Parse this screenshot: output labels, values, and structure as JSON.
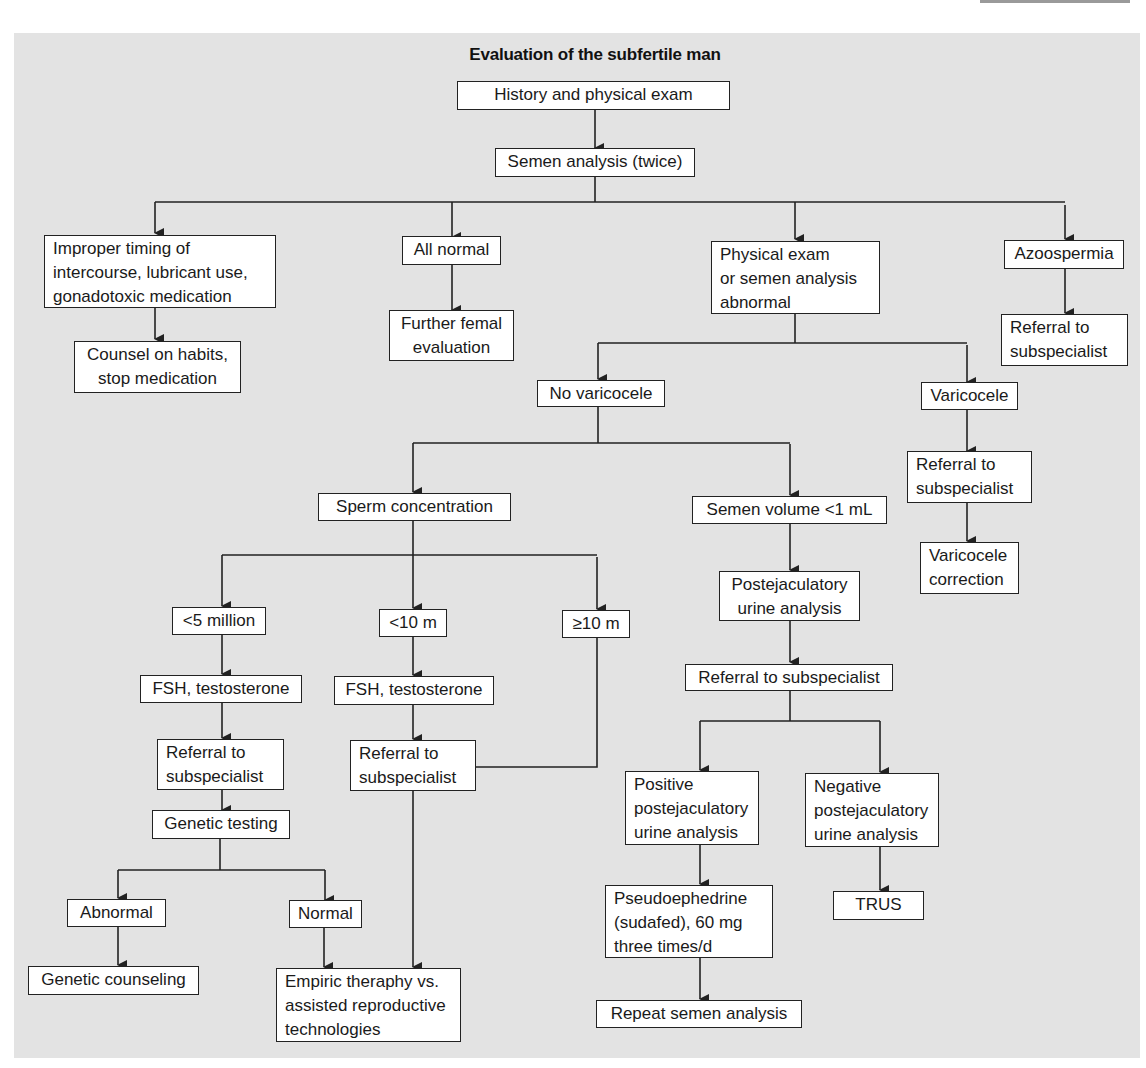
{
  "diagram": {
    "title": "Evaluation of the subfertile man",
    "nodes": {
      "history": {
        "lines": [
          "History and physical exam"
        ]
      },
      "semen_analysis": {
        "lines": [
          "Semen analysis (twice)"
        ]
      },
      "improper_timing": {
        "lines": [
          "Improper timing of",
          "intercourse, lubricant use,",
          "gonadotoxic medication"
        ]
      },
      "counsel": {
        "lines": [
          "Counsel on habits,",
          "stop medication"
        ]
      },
      "all_normal": {
        "lines": [
          "All normal"
        ]
      },
      "further_female": {
        "lines": [
          "Further femal",
          "evaluation"
        ]
      },
      "pe_abnormal": {
        "lines": [
          "Physical exam",
          "or semen analysis",
          "abnormal"
        ]
      },
      "azoospermia": {
        "lines": [
          "Azoospermia"
        ]
      },
      "azoo_referral": {
        "lines": [
          "Referral to",
          "subspecialist"
        ]
      },
      "no_varicocele": {
        "lines": [
          "No varicocele"
        ]
      },
      "varicocele": {
        "lines": [
          "Varicocele"
        ]
      },
      "vari_referral": {
        "lines": [
          "Referral to",
          "subspecialist"
        ]
      },
      "vari_correction": {
        "lines": [
          "Varicocele",
          "correction"
        ]
      },
      "sperm_conc": {
        "lines": [
          "Sperm concentration"
        ]
      },
      "semen_volume": {
        "lines": [
          "Semen volume <1 mL"
        ]
      },
      "lt5": {
        "lines": [
          "<5 million"
        ]
      },
      "lt10": {
        "lines": [
          "<10 m"
        ]
      },
      "ge10": {
        "lines": [
          "≥10 m"
        ]
      },
      "fsh1": {
        "lines": [
          "FSH, testosterone"
        ]
      },
      "fsh2": {
        "lines": [
          "FSH, testosterone"
        ]
      },
      "referral_a": {
        "lines": [
          "Referral to",
          "subspecialist"
        ]
      },
      "referral_b": {
        "lines": [
          "Referral to",
          "subspecialist"
        ]
      },
      "genetic_testing": {
        "lines": [
          "Genetic testing"
        ]
      },
      "abnormal": {
        "lines": [
          "Abnormal"
        ]
      },
      "normal": {
        "lines": [
          "Normal"
        ]
      },
      "genetic_counseling": {
        "lines": [
          "Genetic counseling"
        ]
      },
      "empiric": {
        "lines": [
          "Empiric theraphy vs.",
          "assisted reproductive",
          "technologies"
        ]
      },
      "post_ejac": {
        "lines": [
          "Postejaculatory",
          "urine analysis"
        ]
      },
      "referral_c": {
        "lines": [
          "Referral to subspecialist"
        ]
      },
      "positive_pea": {
        "lines": [
          "Positive",
          "postejaculatory",
          "urine analysis"
        ]
      },
      "negative_pea": {
        "lines": [
          "Negative",
          "postejaculatory",
          "urine analysis"
        ]
      },
      "pseudoephedrine": {
        "lines": [
          "Pseudoephedrine",
          "(sudafed), 60 mg",
          "three times/d"
        ]
      },
      "trus": {
        "lines": [
          "TRUS"
        ]
      },
      "repeat_semen": {
        "lines": [
          "Repeat semen analysis"
        ]
      }
    },
    "edges": [
      [
        "history",
        "semen_analysis"
      ],
      [
        "semen_analysis",
        "improper_timing"
      ],
      [
        "semen_analysis",
        "all_normal"
      ],
      [
        "semen_analysis",
        "pe_abnormal"
      ],
      [
        "semen_analysis",
        "azoospermia"
      ],
      [
        "improper_timing",
        "counsel"
      ],
      [
        "all_normal",
        "further_female"
      ],
      [
        "azoospermia",
        "azoo_referral"
      ],
      [
        "pe_abnormal",
        "no_varicocele"
      ],
      [
        "pe_abnormal",
        "varicocele"
      ],
      [
        "varicocele",
        "vari_referral"
      ],
      [
        "vari_referral",
        "vari_correction"
      ],
      [
        "no_varicocele",
        "sperm_conc"
      ],
      [
        "no_varicocele",
        "semen_volume"
      ],
      [
        "sperm_conc",
        "lt5"
      ],
      [
        "sperm_conc",
        "lt10"
      ],
      [
        "sperm_conc",
        "ge10"
      ],
      [
        "lt5",
        "fsh1"
      ],
      [
        "fsh1",
        "referral_a"
      ],
      [
        "referral_a",
        "genetic_testing"
      ],
      [
        "genetic_testing",
        "abnormal"
      ],
      [
        "genetic_testing",
        "normal"
      ],
      [
        "abnormal",
        "genetic_counseling"
      ],
      [
        "normal",
        "empiric"
      ],
      [
        "lt10",
        "fsh2"
      ],
      [
        "fsh2",
        "referral_b"
      ],
      [
        "ge10",
        "referral_b"
      ],
      [
        "referral_b",
        "empiric"
      ],
      [
        "semen_volume",
        "post_ejac"
      ],
      [
        "post_ejac",
        "referral_c"
      ],
      [
        "referral_c",
        "positive_pea"
      ],
      [
        "referral_c",
        "negative_pea"
      ],
      [
        "positive_pea",
        "pseudoephedrine"
      ],
      [
        "pseudoephedrine",
        "repeat_semen"
      ],
      [
        "negative_pea",
        "trus"
      ]
    ],
    "colors": {
      "background": "#e3e3e3",
      "box_fill": "#ffffff",
      "line": "#222222"
    }
  }
}
